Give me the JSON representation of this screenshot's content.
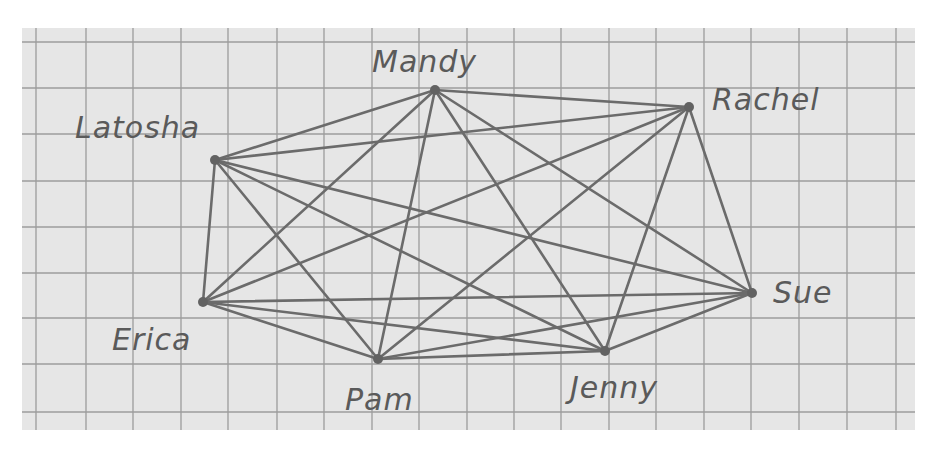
{
  "diagram": {
    "type": "complete-graph",
    "colors": {
      "paper": "#e6e6e6",
      "grid": "#9c9c9c",
      "edge": "#6b6b6b",
      "node": "#626262",
      "label": "#5a5a5a"
    },
    "paper": {
      "x": 22,
      "y": 28,
      "width": 893,
      "height": 402
    },
    "grid": {
      "vertical_x": [
        36,
        86,
        133,
        181,
        228,
        277,
        324,
        372,
        419,
        467,
        514,
        561,
        609,
        656,
        704,
        751,
        799,
        847,
        896
      ],
      "horizontal_y": [
        42,
        88,
        134,
        181,
        227,
        273,
        318,
        364,
        412
      ]
    },
    "nodes": [
      {
        "id": "latosha",
        "label": "Latosha",
        "x": 215,
        "y": 160,
        "label_x": 75,
        "label_y": 138
      },
      {
        "id": "mandy",
        "label": "Mandy",
        "x": 435,
        "y": 90,
        "label_x": 372,
        "label_y": 72
      },
      {
        "id": "rachel",
        "label": "Rachel",
        "x": 689,
        "y": 107,
        "label_x": 712,
        "label_y": 110
      },
      {
        "id": "erica",
        "label": "Erica",
        "x": 203,
        "y": 302,
        "label_x": 112,
        "label_y": 350
      },
      {
        "id": "pam",
        "label": "Pam",
        "x": 378,
        "y": 359,
        "label_x": 345,
        "label_y": 410
      },
      {
        "id": "jenny",
        "label": "Jenny",
        "x": 605,
        "y": 351,
        "label_x": 570,
        "label_y": 398
      },
      {
        "id": "sue",
        "label": "Sue",
        "x": 752,
        "y": 293,
        "label_x": 773,
        "label_y": 303
      }
    ],
    "edges": [
      [
        "latosha",
        "mandy"
      ],
      [
        "latosha",
        "rachel"
      ],
      [
        "latosha",
        "erica"
      ],
      [
        "latosha",
        "pam"
      ],
      [
        "latosha",
        "jenny"
      ],
      [
        "latosha",
        "sue"
      ],
      [
        "mandy",
        "rachel"
      ],
      [
        "mandy",
        "erica"
      ],
      [
        "mandy",
        "pam"
      ],
      [
        "mandy",
        "jenny"
      ],
      [
        "mandy",
        "sue"
      ],
      [
        "rachel",
        "erica"
      ],
      [
        "rachel",
        "pam"
      ],
      [
        "rachel",
        "jenny"
      ],
      [
        "rachel",
        "sue"
      ],
      [
        "erica",
        "pam"
      ],
      [
        "erica",
        "jenny"
      ],
      [
        "erica",
        "sue"
      ],
      [
        "pam",
        "jenny"
      ],
      [
        "pam",
        "sue"
      ],
      [
        "jenny",
        "sue"
      ]
    ]
  }
}
